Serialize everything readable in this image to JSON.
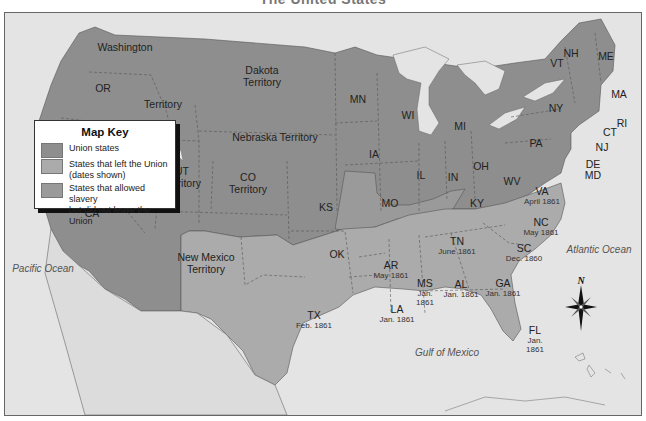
{
  "title": "The United States",
  "colors": {
    "ocean": "#e4e4e4",
    "union": "#8e8e8e",
    "confederate": "#ababab",
    "border_slave": "#9a9a9a",
    "boundary": "#555555"
  },
  "oceans": {
    "pacific": "Pacific Ocean",
    "atlantic": "Atlantic Ocean",
    "gulf": "Gulf of Mexico"
  },
  "compass": {
    "north_label": "N"
  },
  "regions": {
    "washington": {
      "name": "Washington"
    },
    "or": {
      "name": "OR"
    },
    "territory_nw": {
      "name": "Territory"
    },
    "dakota": {
      "name": "Dakota\nTerritory",
      "line1": "Dakota",
      "line2": "Territory"
    },
    "nebraska": {
      "name": "Nebraska Territory"
    },
    "nv": {
      "line1": "NV",
      "line2": "Territory"
    },
    "ut": {
      "line1": "UT",
      "line2": "Territory"
    },
    "co": {
      "line1": "CO",
      "line2": "Territory"
    },
    "ca": {
      "name": "CA"
    },
    "ks": {
      "name": "KS"
    },
    "nm": {
      "line1": "New Mexico",
      "line2": "Territory"
    },
    "ok": {
      "name": "OK"
    },
    "mn": {
      "name": "MN"
    },
    "wi": {
      "name": "WI"
    },
    "mi": {
      "name": "MI"
    },
    "ia": {
      "name": "IA"
    },
    "il": {
      "name": "IL"
    },
    "in": {
      "name": "IN"
    },
    "oh": {
      "name": "OH"
    },
    "mo": {
      "name": "MO"
    },
    "ky": {
      "name": "KY"
    },
    "wv": {
      "name": "WV"
    },
    "pa": {
      "name": "PA"
    },
    "ny": {
      "name": "NY"
    },
    "me": {
      "name": "ME"
    },
    "nh": {
      "name": "NH"
    },
    "vt": {
      "name": "VT"
    },
    "ma": {
      "name": "MA"
    },
    "ri": {
      "name": "RI"
    },
    "ct": {
      "name": "CT"
    },
    "nj": {
      "name": "NJ"
    },
    "de": {
      "name": "DE"
    },
    "md": {
      "name": "MD"
    },
    "va": {
      "name": "VA",
      "date": "April 1861"
    },
    "nc": {
      "name": "NC",
      "date": "May 1861"
    },
    "tn": {
      "name": "TN",
      "date": "June 1861"
    },
    "sc": {
      "name": "SC",
      "date": "Dec. 1860"
    },
    "ar": {
      "name": "AR",
      "date": "May 1861"
    },
    "ms": {
      "name": "MS",
      "date1": "Jan.",
      "date2": "1861"
    },
    "al": {
      "name": "AL",
      "date": "Jan. 1861"
    },
    "ga": {
      "name": "GA",
      "date": "Jan. 1861"
    },
    "la": {
      "name": "LA",
      "date": "Jan. 1861"
    },
    "fl": {
      "name": "FL",
      "date1": "Jan.",
      "date2": "1861"
    },
    "tx": {
      "name": "TX",
      "date": "Feb. 1861"
    }
  },
  "map_key": {
    "title": "Map Key",
    "items": [
      {
        "label1": "Union states",
        "label2": "",
        "color": "#8e8e8e"
      },
      {
        "label1": "States that left the Union",
        "label2": "(dates shown)",
        "color": "#ababab"
      },
      {
        "label1": "States that allowed slavery",
        "label2": "but did not leave the Union",
        "color": "#9a9a9a"
      }
    ]
  }
}
